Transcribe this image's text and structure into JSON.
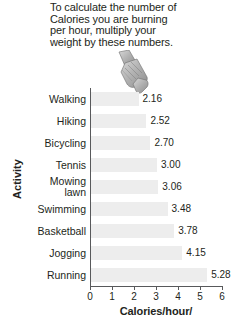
{
  "caption": {
    "lines": [
      "To calculate the number of",
      "Calories you are burning",
      "per hour, multiply your",
      "weight by these numbers."
    ]
  },
  "icons": {
    "pointing_hand": "pointing-hand"
  },
  "chart_data": {
    "type": "bar",
    "orientation": "horizontal",
    "title": "",
    "xlabel": "Calories/hour/",
    "ylabel": "Activity",
    "xlim": [
      0,
      6
    ],
    "xticks": [
      0,
      1,
      2,
      3,
      4,
      5,
      6
    ],
    "xtick_labels": [
      "0",
      "1",
      "2",
      "3",
      "4",
      "5",
      "6"
    ],
    "grid": false,
    "legend": false,
    "bar_color": "#ededed",
    "axis_color": "#58595b",
    "text_color": "#231f20",
    "categories": [
      "Walking",
      "Hiking",
      "Bicycling",
      "Tennis",
      "Mowing\nlawn",
      "Swimming",
      "Basketball",
      "Jogging",
      "Running"
    ],
    "values": [
      2.16,
      2.52,
      2.7,
      3.0,
      3.06,
      3.48,
      3.78,
      4.15,
      5.28
    ],
    "value_labels": [
      "2.16",
      "2.52",
      "2.70",
      "3.00",
      "3.06",
      "3.48",
      "3.78",
      "4.15",
      "5.28"
    ]
  }
}
